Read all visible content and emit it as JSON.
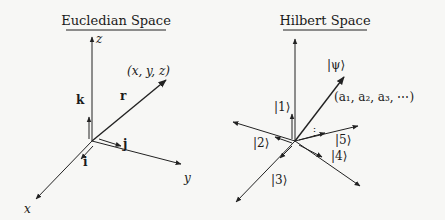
{
  "left_panel": {
    "title": "Eucledian Space",
    "axis_labels": {
      "z": "z",
      "x": "x",
      "y": "y"
    },
    "vector_label": "r",
    "point_label": "(x, y, z)",
    "unit_vectors": {
      "i": "i",
      "j": "j",
      "k": "k"
    }
  },
  "right_panel": {
    "title": "Hilbert Space",
    "state_label": "|ψ⟩",
    "coefficients_label": "(a₁, a₂, a₃, ⋯)",
    "basis_labels": [
      "|1⟩",
      "|2⟩",
      "|3⟩",
      "|4⟩",
      "|5⟩"
    ],
    "ellipsis": "⋮"
  },
  "colors": {
    "ink": "#222222",
    "background": "#f7f7f5"
  }
}
